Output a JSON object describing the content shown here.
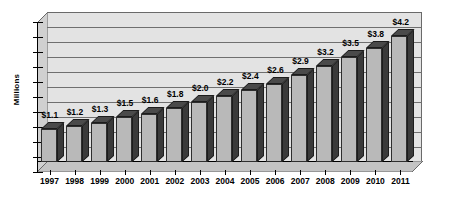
{
  "chart_data": {
    "type": "bar",
    "title": "",
    "subtitle": "",
    "xlabel": "",
    "ylabel": "Millions",
    "categories": [
      "1997",
      "1998",
      "1999",
      "2000",
      "2001",
      "2002",
      "2003",
      "2004",
      "2005",
      "2006",
      "2007",
      "2008",
      "2009",
      "2010",
      "2011"
    ],
    "values": [
      1.1,
      1.2,
      1.3,
      1.5,
      1.6,
      1.8,
      2.0,
      2.2,
      2.4,
      2.6,
      2.9,
      3.2,
      3.5,
      3.8,
      4.2
    ],
    "data_labels": [
      "$1.1",
      "$1.2",
      "$1.3",
      "$1.5",
      "$1.6",
      "$1.8",
      "$2.0",
      "$2.2",
      "$2.4",
      "$2.6",
      "$2.9",
      "$3.2",
      "$3.5",
      "$3.8",
      "$4.2"
    ],
    "ylim": [
      0,
      5.0
    ],
    "ytick_count": 10,
    "grid": true,
    "gridlines_horizontal": 9,
    "legend": "none",
    "style": "3d-column",
    "colors": {
      "bar_front": "#b9b9b9",
      "bar_side": "#3a3a3a",
      "bar_top": "#4a4a4a",
      "plot_background": "#e3e3e3",
      "wall_depth": "#d0d0d0",
      "floor_depth": "#c4c4c4",
      "axis": "#000000",
      "gridline": "#6f6f6f",
      "text": "#000000",
      "page_background": "#ffffff"
    }
  }
}
